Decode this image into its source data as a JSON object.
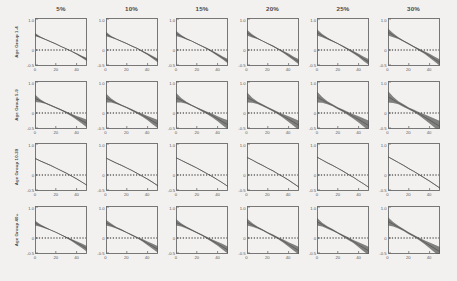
{
  "figure": {
    "background": "#f2f1ef",
    "frame_color": "#6b6b6b",
    "line_color": "#555555",
    "band_color": "#5a5a5a",
    "ref_line_color": "#1c1c1c",
    "rows": 4,
    "cols": 6
  },
  "columns": [
    {
      "label": "5%"
    },
    {
      "label": "10%"
    },
    {
      "label": "15%"
    },
    {
      "label": "20%"
    },
    {
      "label": "25%"
    },
    {
      "label": "30%"
    }
  ],
  "rows": [
    {
      "label": "Age Group 1-4"
    },
    {
      "label": "Age Group 5-9"
    },
    {
      "label": "Age Group 10-39"
    },
    {
      "label": "Age Group 40+"
    }
  ],
  "axes": {
    "xticks": [
      "0",
      "20",
      "40"
    ],
    "xtickvals": [
      0,
      20,
      40
    ],
    "yticks": [
      "1.0",
      "0",
      "-0.5"
    ],
    "ytickvals": [
      1.0,
      0,
      -0.5
    ],
    "xlim": [
      0,
      50
    ],
    "ylim": [
      -0.5,
      1.0
    ],
    "ref_line_y": 0
  },
  "chart_data": {
    "type": "line",
    "title": "",
    "xlabel": "",
    "ylabel": "",
    "xlim": [
      0,
      50
    ],
    "ylim": [
      -0.5,
      1.0
    ],
    "grid": false,
    "legend": "none",
    "ref_lines": [
      {
        "y": 0,
        "style": "dotted",
        "color": "#1c1c1c"
      }
    ],
    "col_headers": [
      "5%",
      "10%",
      "15%",
      "20%",
      "25%",
      "30%"
    ],
    "row_headers": [
      "Age Group 1-4",
      "Age Group 5-9",
      "Age Group 10-39",
      "Age Group 40+"
    ],
    "x": [
      0,
      5,
      10,
      15,
      20,
      25,
      30,
      35,
      40,
      45,
      50
    ],
    "panels": [
      {
        "row": 0,
        "col": 0,
        "row_label": "Age Group 1-4",
        "col_label": "5%",
        "values": [
          0.48,
          0.4,
          0.33,
          0.26,
          0.19,
          0.11,
          0.04,
          -0.04,
          -0.12,
          -0.21,
          -0.3
        ],
        "band_halfwidth": [
          0.05,
          0.02,
          0.01,
          0.01,
          0.01,
          0.01,
          0.01,
          0.01,
          0.02,
          0.03,
          0.05
        ]
      },
      {
        "row": 0,
        "col": 1,
        "row_label": "Age Group 1-4",
        "col_label": "10%",
        "values": [
          0.5,
          0.41,
          0.34,
          0.27,
          0.2,
          0.12,
          0.05,
          -0.04,
          -0.13,
          -0.23,
          -0.33
        ],
        "band_halfwidth": [
          0.07,
          0.03,
          0.01,
          0.01,
          0.01,
          0.01,
          0.01,
          0.02,
          0.03,
          0.04,
          0.06
        ]
      },
      {
        "row": 0,
        "col": 2,
        "row_label": "Age Group 1-4",
        "col_label": "15%",
        "values": [
          0.52,
          0.43,
          0.35,
          0.28,
          0.2,
          0.12,
          0.04,
          -0.05,
          -0.15,
          -0.25,
          -0.35
        ],
        "band_halfwidth": [
          0.08,
          0.04,
          0.02,
          0.01,
          0.01,
          0.01,
          0.02,
          0.03,
          0.04,
          0.05,
          0.07
        ]
      },
      {
        "row": 0,
        "col": 3,
        "row_label": "Age Group 1-4",
        "col_label": "20%",
        "values": [
          0.54,
          0.44,
          0.36,
          0.28,
          0.2,
          0.12,
          0.03,
          -0.06,
          -0.16,
          -0.27,
          -0.37
        ],
        "band_halfwidth": [
          0.09,
          0.05,
          0.02,
          0.01,
          0.01,
          0.02,
          0.02,
          0.03,
          0.05,
          0.06,
          0.08
        ]
      },
      {
        "row": 0,
        "col": 4,
        "row_label": "Age Group 1-4",
        "col_label": "25%",
        "values": [
          0.55,
          0.45,
          0.36,
          0.28,
          0.2,
          0.11,
          0.02,
          -0.07,
          -0.17,
          -0.28,
          -0.38
        ],
        "band_halfwidth": [
          0.1,
          0.05,
          0.03,
          0.02,
          0.01,
          0.02,
          0.03,
          0.04,
          0.05,
          0.07,
          0.09
        ]
      },
      {
        "row": 0,
        "col": 5,
        "row_label": "Age Group 1-4",
        "col_label": "30%",
        "values": [
          0.56,
          0.46,
          0.37,
          0.28,
          0.19,
          0.1,
          0.01,
          -0.08,
          -0.18,
          -0.29,
          -0.4
        ],
        "band_halfwidth": [
          0.11,
          0.06,
          0.03,
          0.02,
          0.02,
          0.02,
          0.03,
          0.04,
          0.06,
          0.08,
          0.1
        ]
      },
      {
        "row": 1,
        "col": 0,
        "row_label": "Age Group 5-9",
        "col_label": "5%",
        "values": [
          0.46,
          0.38,
          0.31,
          0.24,
          0.17,
          0.1,
          0.02,
          -0.06,
          -0.15,
          -0.24,
          -0.33
        ],
        "band_halfwidth": [
          0.12,
          0.05,
          0.02,
          0.02,
          0.02,
          0.02,
          0.03,
          0.04,
          0.06,
          0.09,
          0.12
        ]
      },
      {
        "row": 1,
        "col": 1,
        "row_label": "Age Group 5-9",
        "col_label": "10%",
        "values": [
          0.47,
          0.39,
          0.31,
          0.24,
          0.17,
          0.09,
          0.01,
          -0.07,
          -0.16,
          -0.26,
          -0.35
        ],
        "band_halfwidth": [
          0.14,
          0.06,
          0.03,
          0.02,
          0.02,
          0.03,
          0.03,
          0.05,
          0.07,
          0.1,
          0.13
        ]
      },
      {
        "row": 1,
        "col": 2,
        "row_label": "Age Group 5-9",
        "col_label": "15%",
        "values": [
          0.48,
          0.4,
          0.32,
          0.24,
          0.16,
          0.08,
          0.0,
          -0.08,
          -0.18,
          -0.28,
          -0.37
        ],
        "band_halfwidth": [
          0.15,
          0.07,
          0.03,
          0.02,
          0.02,
          0.03,
          0.04,
          0.06,
          0.08,
          0.11,
          0.14
        ]
      },
      {
        "row": 1,
        "col": 3,
        "row_label": "Age Group 5-9",
        "col_label": "20%",
        "values": [
          0.49,
          0.4,
          0.32,
          0.24,
          0.16,
          0.08,
          -0.01,
          -0.1,
          -0.19,
          -0.29,
          -0.39
        ],
        "band_halfwidth": [
          0.16,
          0.08,
          0.04,
          0.03,
          0.03,
          0.03,
          0.04,
          0.06,
          0.09,
          0.12,
          0.15
        ]
      },
      {
        "row": 1,
        "col": 4,
        "row_label": "Age Group 5-9",
        "col_label": "25%",
        "values": [
          0.5,
          0.41,
          0.32,
          0.24,
          0.15,
          0.07,
          -0.02,
          -0.11,
          -0.2,
          -0.3,
          -0.4
        ],
        "band_halfwidth": [
          0.17,
          0.09,
          0.05,
          0.03,
          0.03,
          0.04,
          0.05,
          0.07,
          0.1,
          0.13,
          0.16
        ]
      },
      {
        "row": 1,
        "col": 5,
        "row_label": "Age Group 5-9",
        "col_label": "30%",
        "values": [
          0.51,
          0.41,
          0.32,
          0.23,
          0.14,
          0.06,
          -0.03,
          -0.12,
          -0.22,
          -0.32,
          -0.42
        ],
        "band_halfwidth": [
          0.18,
          0.1,
          0.05,
          0.04,
          0.03,
          0.04,
          0.05,
          0.08,
          0.11,
          0.14,
          0.17
        ]
      },
      {
        "row": 2,
        "col": 0,
        "row_label": "Age Group 10-39",
        "col_label": "5%",
        "values": [
          0.52,
          0.44,
          0.37,
          0.3,
          0.22,
          0.14,
          0.06,
          -0.03,
          -0.12,
          -0.22,
          -0.32
        ],
        "band_halfwidth": [
          0.01,
          0.01,
          0.01,
          0.01,
          0.01,
          0.01,
          0.01,
          0.01,
          0.01,
          0.01,
          0.01
        ]
      },
      {
        "row": 2,
        "col": 1,
        "row_label": "Age Group 10-39",
        "col_label": "10%",
        "values": [
          0.53,
          0.45,
          0.37,
          0.3,
          0.22,
          0.14,
          0.05,
          -0.04,
          -0.13,
          -0.23,
          -0.34
        ],
        "band_halfwidth": [
          0.01,
          0.01,
          0.01,
          0.01,
          0.01,
          0.01,
          0.01,
          0.01,
          0.01,
          0.01,
          0.01
        ]
      },
      {
        "row": 2,
        "col": 2,
        "row_label": "Age Group 10-39",
        "col_label": "15%",
        "values": [
          0.54,
          0.46,
          0.38,
          0.3,
          0.22,
          0.13,
          0.04,
          -0.05,
          -0.15,
          -0.25,
          -0.36
        ],
        "band_halfwidth": [
          0.01,
          0.01,
          0.01,
          0.01,
          0.01,
          0.01,
          0.01,
          0.01,
          0.01,
          0.01,
          0.01
        ]
      },
      {
        "row": 2,
        "col": 3,
        "row_label": "Age Group 10-39",
        "col_label": "20%",
        "values": [
          0.55,
          0.47,
          0.38,
          0.3,
          0.21,
          0.13,
          0.03,
          -0.06,
          -0.16,
          -0.27,
          -0.38
        ],
        "band_halfwidth": [
          0.01,
          0.01,
          0.01,
          0.01,
          0.01,
          0.01,
          0.01,
          0.01,
          0.01,
          0.01,
          0.01
        ]
      },
      {
        "row": 2,
        "col": 4,
        "row_label": "Age Group 10-39",
        "col_label": "25%",
        "values": [
          0.56,
          0.47,
          0.38,
          0.3,
          0.21,
          0.12,
          0.02,
          -0.07,
          -0.18,
          -0.28,
          -0.39
        ],
        "band_halfwidth": [
          0.01,
          0.01,
          0.01,
          0.01,
          0.01,
          0.01,
          0.01,
          0.01,
          0.01,
          0.01,
          0.01
        ]
      },
      {
        "row": 2,
        "col": 5,
        "row_label": "Age Group 10-39",
        "col_label": "30%",
        "values": [
          0.57,
          0.48,
          0.39,
          0.3,
          0.2,
          0.11,
          0.01,
          -0.09,
          -0.19,
          -0.3,
          -0.41
        ],
        "band_halfwidth": [
          0.01,
          0.01,
          0.01,
          0.01,
          0.01,
          0.01,
          0.01,
          0.01,
          0.01,
          0.01,
          0.01
        ]
      },
      {
        "row": 3,
        "col": 0,
        "row_label": "Age Group 40+",
        "col_label": "5%",
        "values": [
          0.47,
          0.39,
          0.32,
          0.25,
          0.18,
          0.1,
          0.02,
          -0.06,
          -0.15,
          -0.24,
          -0.34
        ],
        "band_halfwidth": [
          0.08,
          0.04,
          0.02,
          0.01,
          0.01,
          0.01,
          0.02,
          0.03,
          0.05,
          0.07,
          0.09
        ]
      },
      {
        "row": 3,
        "col": 1,
        "row_label": "Age Group 40+",
        "col_label": "10%",
        "values": [
          0.48,
          0.4,
          0.32,
          0.25,
          0.17,
          0.09,
          0.01,
          -0.07,
          -0.17,
          -0.26,
          -0.36
        ],
        "band_halfwidth": [
          0.09,
          0.05,
          0.02,
          0.02,
          0.01,
          0.02,
          0.02,
          0.04,
          0.06,
          0.08,
          0.1
        ]
      },
      {
        "row": 3,
        "col": 2,
        "row_label": "Age Group 40+",
        "col_label": "15%",
        "values": [
          0.49,
          0.41,
          0.33,
          0.25,
          0.17,
          0.09,
          0.0,
          -0.09,
          -0.18,
          -0.28,
          -0.38
        ],
        "band_halfwidth": [
          0.1,
          0.05,
          0.03,
          0.02,
          0.02,
          0.02,
          0.03,
          0.04,
          0.06,
          0.09,
          0.11
        ]
      },
      {
        "row": 3,
        "col": 3,
        "row_label": "Age Group 40+",
        "col_label": "20%",
        "values": [
          0.5,
          0.41,
          0.33,
          0.25,
          0.16,
          0.08,
          -0.01,
          -0.1,
          -0.2,
          -0.3,
          -0.4
        ],
        "band_halfwidth": [
          0.11,
          0.06,
          0.03,
          0.02,
          0.02,
          0.03,
          0.03,
          0.05,
          0.07,
          0.1,
          0.12
        ]
      },
      {
        "row": 3,
        "col": 4,
        "row_label": "Age Group 40+",
        "col_label": "25%",
        "values": [
          0.51,
          0.42,
          0.33,
          0.25,
          0.16,
          0.07,
          -0.02,
          -0.11,
          -0.21,
          -0.31,
          -0.41
        ],
        "band_halfwidth": [
          0.12,
          0.06,
          0.04,
          0.03,
          0.02,
          0.03,
          0.04,
          0.05,
          0.08,
          0.11,
          0.13
        ]
      },
      {
        "row": 3,
        "col": 5,
        "row_label": "Age Group 40+",
        "col_label": "30%",
        "values": [
          0.52,
          0.43,
          0.34,
          0.25,
          0.15,
          0.06,
          -0.03,
          -0.13,
          -0.23,
          -0.33,
          -0.43
        ],
        "band_halfwidth": [
          0.13,
          0.07,
          0.04,
          0.03,
          0.03,
          0.03,
          0.04,
          0.06,
          0.09,
          0.12,
          0.15
        ]
      }
    ]
  }
}
